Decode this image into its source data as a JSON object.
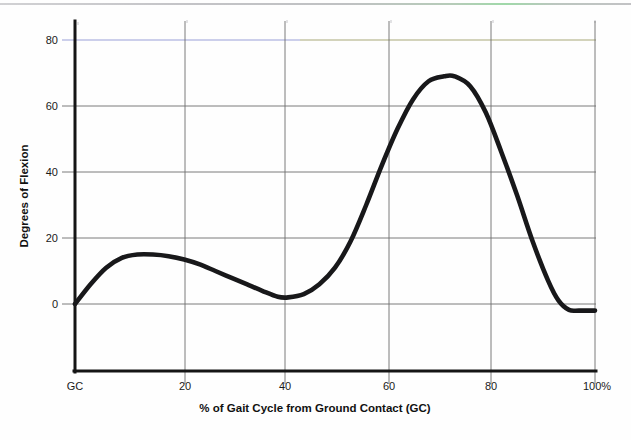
{
  "chart_data": {
    "type": "line",
    "title": "",
    "xlabel": "% of Gait Cycle from Ground Contact (GC)",
    "ylabel": "Degrees of Flexion",
    "xlim": [
      0,
      100
    ],
    "ylim": [
      -10,
      85
    ],
    "grid": true,
    "legend": "none",
    "x_tick_labels": [
      "GC",
      "20",
      "40",
      "60",
      "80",
      "100%"
    ],
    "x_tick_values": [
      0,
      20,
      40,
      60,
      80,
      100
    ],
    "y_tick_labels": [
      "0",
      "20",
      "40",
      "60",
      "80"
    ],
    "y_tick_values": [
      0,
      20,
      40,
      60,
      80
    ],
    "series": [
      {
        "name": "Knee flexion",
        "x": [
          0,
          3,
          6,
          9,
          12,
          15,
          18,
          21,
          24,
          27,
          30,
          33,
          36,
          39,
          41,
          44,
          47,
          50,
          53,
          56,
          59,
          62,
          65,
          68,
          71,
          73,
          76,
          79,
          82,
          85,
          88,
          91,
          93,
          95,
          97,
          100
        ],
        "values": [
          0,
          6,
          11,
          14,
          15,
          15,
          14.5,
          13.5,
          12,
          10,
          8,
          6,
          4,
          2.2,
          2,
          3,
          6,
          11,
          19,
          30,
          42,
          53,
          62,
          67.5,
          69,
          69,
          66,
          58,
          46,
          33,
          19,
          7,
          1,
          -1.8,
          -2,
          -2
        ]
      }
    ]
  },
  "axes": {
    "y_title": "Degrees of Flexion",
    "x_title": "% of Gait Cycle from Ground Contact (GC)"
  }
}
